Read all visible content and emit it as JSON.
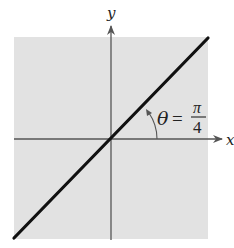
{
  "diagram": {
    "type": "coordinate-plane",
    "background_color": "#e2e2e2",
    "axis_color": "#555555",
    "line_color": "#111111",
    "axes": {
      "x_label": "x",
      "y_label": "y"
    },
    "line": {
      "description": "line through origin with angle pi/4 to positive x-axis",
      "slope": 1
    },
    "angle_annotation": {
      "symbol": "θ",
      "equals": "=",
      "numerator": "π",
      "denominator": "4"
    }
  }
}
